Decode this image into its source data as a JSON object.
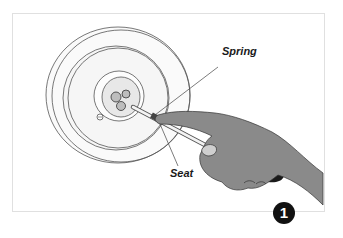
{
  "figure": {
    "labels": {
      "spring": "Spring",
      "seat": "Seat"
    },
    "step_number": "1",
    "colors": {
      "outline": "#555555",
      "hand": "#8a8a8a",
      "handle": "#1a1a1a",
      "badge": "#111111",
      "frame_border": "#e0e0e0"
    }
  }
}
